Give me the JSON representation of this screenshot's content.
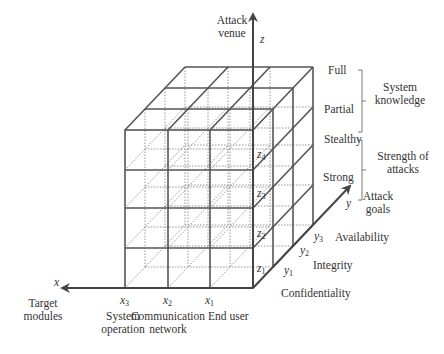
{
  "axes": {
    "z": {
      "symbol": "z",
      "title_line1": "Attack",
      "title_line2": "venue"
    },
    "x": {
      "symbol": "x",
      "title_line1": "Target",
      "title_line2": "modules"
    },
    "y": {
      "symbol": "y",
      "title_line1": "Attack",
      "title_line2": "goals"
    }
  },
  "z_ticks": [
    {
      "sym": "z",
      "sub": "1"
    },
    {
      "sym": "z",
      "sub": "2"
    },
    {
      "sym": "z",
      "sub": "3"
    },
    {
      "sym": "z",
      "sub": "4"
    }
  ],
  "x_ticks": [
    {
      "sym": "x",
      "sub": "3",
      "label_line1": "System",
      "label_line2": "operation"
    },
    {
      "sym": "x",
      "sub": "2",
      "label_line1": "Communication",
      "label_line2": "network"
    },
    {
      "sym": "x",
      "sub": "1",
      "label_line1": "End user",
      "label_line2": ""
    }
  ],
  "y_ticks": [
    {
      "sym": "y",
      "sub": "1",
      "label": "Confidentiality"
    },
    {
      "sym": "y",
      "sub": "2",
      "label": "Integrity"
    },
    {
      "sym": "y",
      "sub": "3",
      "label": "Availability"
    }
  ],
  "groups": {
    "knowledge": {
      "top": "Full",
      "bottom": "Partial",
      "title_line1": "System",
      "title_line2": "knowledge"
    },
    "strength": {
      "top": "Stealthy",
      "bottom": "Strong",
      "title_line1": "Strength of",
      "title_line2": "attacks"
    }
  },
  "colors": {
    "solid": "#555555",
    "dotted": "#8a8a8a",
    "axis": "#444444"
  }
}
